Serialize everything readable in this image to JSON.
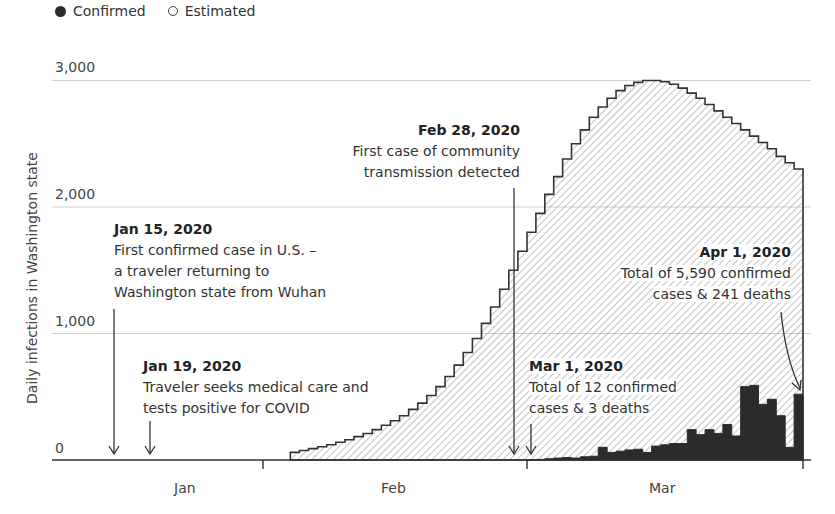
{
  "legend": {
    "confirmed": "Confirmed",
    "estimated": "Estimated"
  },
  "colors": {
    "confirmed": "#2b2b2b",
    "estimated_outline": "#333333",
    "hatch": "#9a9a9a",
    "gridline": "#cfcfcf"
  },
  "axis": {
    "ylabel": "Daily infections in Washington state",
    "yticks": [
      "0",
      "1,000",
      "2,000",
      "3,000"
    ],
    "xticks": [
      "Jan",
      "Feb",
      "Mar"
    ]
  },
  "annotations": [
    {
      "date": "Jan 15, 2020",
      "lines": [
        "First confirmed case in U.S. –",
        "a traveler returning to",
        "Washington state from Wuhan"
      ]
    },
    {
      "date": "Jan 19, 2020",
      "lines": [
        "Traveler seeks medical care and",
        "tests positive for COVID"
      ]
    },
    {
      "date": "Feb 28, 2020",
      "lines": [
        "First case of community",
        "transmission detected"
      ]
    },
    {
      "date": "Mar 1, 2020",
      "lines": [
        "Total of 12 confirmed",
        "cases & 3 deaths"
      ]
    },
    {
      "date": "Apr 1, 2020",
      "lines": [
        "Total of 5,590 confirmed",
        "cases & 241 deaths"
      ]
    }
  ],
  "chart_data": {
    "type": "bar",
    "title": "",
    "xlabel": "",
    "ylabel": "Daily infections in Washington state",
    "ylim": [
      0,
      3000
    ],
    "yticks": [
      0,
      1000,
      2000,
      3000
    ],
    "grid": true,
    "legend_position": "top-left",
    "x_range": [
      "2020-01-01",
      "2020-04-01"
    ],
    "month_labels": [
      "Jan",
      "Feb",
      "Mar"
    ],
    "series": [
      {
        "name": "Estimated",
        "style": "hatched step area",
        "start_date": "2020-02-04",
        "values": [
          60,
          75,
          90,
          105,
          120,
          140,
          160,
          185,
          210,
          240,
          275,
          310,
          350,
          400,
          450,
          510,
          580,
          660,
          750,
          850,
          960,
          1080,
          1210,
          1350,
          1500,
          1650,
          1800,
          1950,
          2100,
          2240,
          2380,
          2500,
          2610,
          2710,
          2790,
          2860,
          2920,
          2960,
          2985,
          3000,
          3000,
          2990,
          2970,
          2940,
          2900,
          2860,
          2810,
          2760,
          2710,
          2660,
          2610,
          2560,
          2510,
          2460,
          2400,
          2350,
          2300
        ]
      },
      {
        "name": "Confirmed",
        "style": "solid dark step bars",
        "start_date": "2020-03-01",
        "values": [
          0,
          5,
          10,
          15,
          20,
          15,
          25,
          30,
          100,
          60,
          70,
          80,
          85,
          60,
          110,
          120,
          130,
          130,
          240,
          200,
          240,
          210,
          280,
          190,
          580,
          590,
          440,
          480,
          350,
          100,
          520
        ]
      }
    ],
    "annotations": [
      {
        "date": "2020-01-15",
        "text": "First confirmed case in U.S. – a traveler returning to Washington state from Wuhan"
      },
      {
        "date": "2020-01-19",
        "text": "Traveler seeks medical care and tests positive for COVID"
      },
      {
        "date": "2020-02-28",
        "text": "First case of community transmission detected"
      },
      {
        "date": "2020-03-01",
        "text": "Total of 12 confirmed cases & 3 deaths"
      },
      {
        "date": "2020-04-01",
        "text": "Total of 5,590 confirmed cases & 241 deaths"
      }
    ]
  }
}
